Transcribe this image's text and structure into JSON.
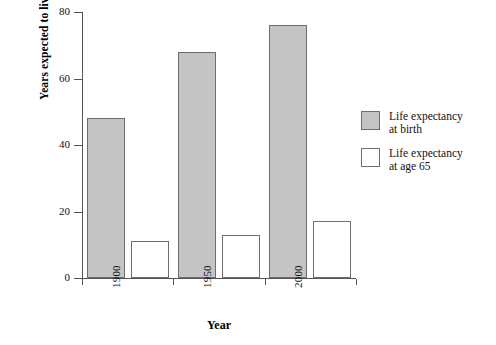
{
  "chart_data": {
    "type": "bar",
    "title": "",
    "xlabel": "Year",
    "ylabel": "Years expected to live",
    "categories": [
      "1900",
      "1950",
      "2000"
    ],
    "series": [
      {
        "name": "Life expectancy\nat birth",
        "values": [
          48,
          68,
          76
        ],
        "color": "#c4c4c4"
      },
      {
        "name": "Life expectancy\nat age 65",
        "values": [
          11,
          13,
          17
        ],
        "color": "#ffffff"
      }
    ],
    "ylim": [
      0,
      80
    ],
    "yticks": [
      0,
      20,
      40,
      60,
      80
    ],
    "ytick_labels": [
      "0",
      "20",
      "40",
      "60",
      "80"
    ],
    "grid": false,
    "legend_position": "right"
  },
  "legend": {
    "entries": [
      {
        "label": "Life expectancy\nat birth",
        "swatch": "gray"
      },
      {
        "label": "Life expectancy\nat age 65",
        "swatch": "white"
      }
    ]
  },
  "colors": {
    "bar_gray": "#c4c4c4",
    "bar_white": "#ffffff",
    "bar_border": "#6e6e6e",
    "axis": "#555555",
    "text": "#111111",
    "background": "#ffffff"
  }
}
